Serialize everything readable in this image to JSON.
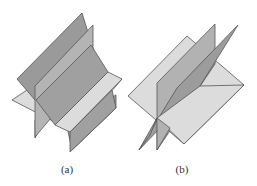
{
  "figure": {
    "panels": [
      {
        "id": "a",
        "caption": "(a)",
        "description": "Three planes intersecting in three parallel lines (no common point)"
      },
      {
        "id": "b",
        "caption": "(b)",
        "description": "Three planes intersecting in a single common line"
      }
    ],
    "colors": {
      "dark_plane": "#9a9a9a",
      "mid_plane": "#b2b2b2",
      "light_plane": "#dcdcdc",
      "edge": "#555555",
      "background": "#ffffff"
    }
  }
}
